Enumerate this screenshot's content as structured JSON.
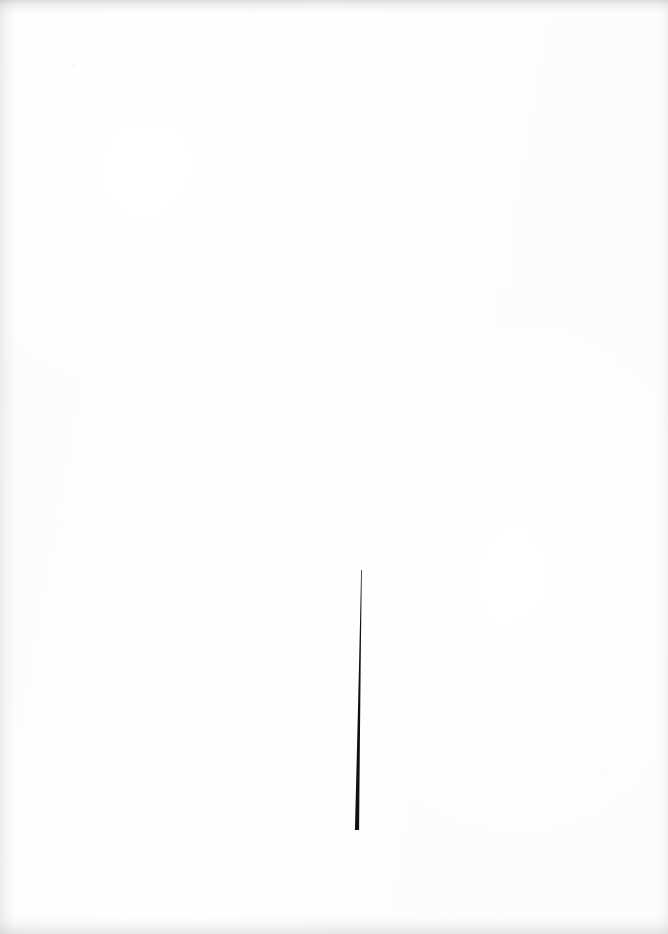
{
  "canvas": {
    "width": 668,
    "height": 934,
    "background_color": "#fdfdfd",
    "medium": "scanned paper",
    "description": "Nearly blank off-white scanned sheet bearing a single mark"
  },
  "artwork": {
    "title": "Single Tapered Vertical Stroke",
    "content_summary": "One thin near-vertical black brush stroke in the lower-middle of an otherwise empty white page",
    "mark_count": 1,
    "composition": {
      "region": "lower-center",
      "horizontal_position_pct": 54,
      "vertical_extent_pct": [
        61,
        89
      ],
      "surrounding": "empty white field"
    }
  },
  "marks": [
    {
      "name": "tapered-vertical-stroke",
      "kind": "line",
      "ink_color": "#111111",
      "tip_top": {
        "x": 361.5,
        "y": 570
      },
      "tip_bottom": {
        "x": 357.0,
        "y": 830
      },
      "length_px": 260,
      "width_top_px": 0.8,
      "width_bottom_px": 4.2,
      "taper": "widens from hairline at top to blunt squared end at bottom",
      "lean": "bottom end sits about 4 px left of top end",
      "orientation_deg_from_vertical": -1.0,
      "end_cap_top": "pointed",
      "end_cap_bottom": "flat"
    }
  ],
  "texture": {
    "grain": "faint pale specks scattered across the sheet",
    "edge_artifacts": [
      "top edge band",
      "bottom edge band",
      "left edge band"
    ],
    "edge_tint_color": "#92929a"
  }
}
